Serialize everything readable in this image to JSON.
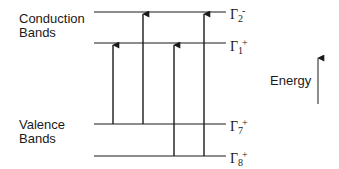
{
  "diagram": {
    "title": "",
    "groups": {
      "conduction": {
        "line1": "Conduction",
        "line2": "Bands"
      },
      "valence": {
        "line1": "Valence",
        "line2": "Bands"
      }
    },
    "levels": [
      {
        "id": "gamma2-minus",
        "symbol": "Γ",
        "sub": "2",
        "sup": "-",
        "y": 12,
        "band": "conduction"
      },
      {
        "id": "gamma1-plus",
        "symbol": "Γ",
        "sub": "1",
        "sup": "+",
        "y": 43,
        "band": "conduction"
      },
      {
        "id": "gamma7-plus",
        "symbol": "Γ",
        "sub": "7",
        "sup": "+",
        "y": 124,
        "band": "valence"
      },
      {
        "id": "gamma8-plus",
        "symbol": "Γ",
        "sub": "8",
        "sup": "+",
        "y": 156,
        "band": "valence"
      }
    ],
    "transitions": [
      {
        "from": "Γ7+",
        "to": "Γ1+",
        "x": 113
      },
      {
        "from": "Γ7+",
        "to": "Γ2-",
        "x": 143
      },
      {
        "from": "Γ8+",
        "to": "Γ1+",
        "x": 174
      },
      {
        "from": "Γ8+",
        "to": "Γ2-",
        "x": 204
      }
    ],
    "axis": {
      "label": "Energy",
      "direction": "up"
    },
    "colors": {
      "ink": "#1a1a1a",
      "background": "#ffffff"
    }
  }
}
